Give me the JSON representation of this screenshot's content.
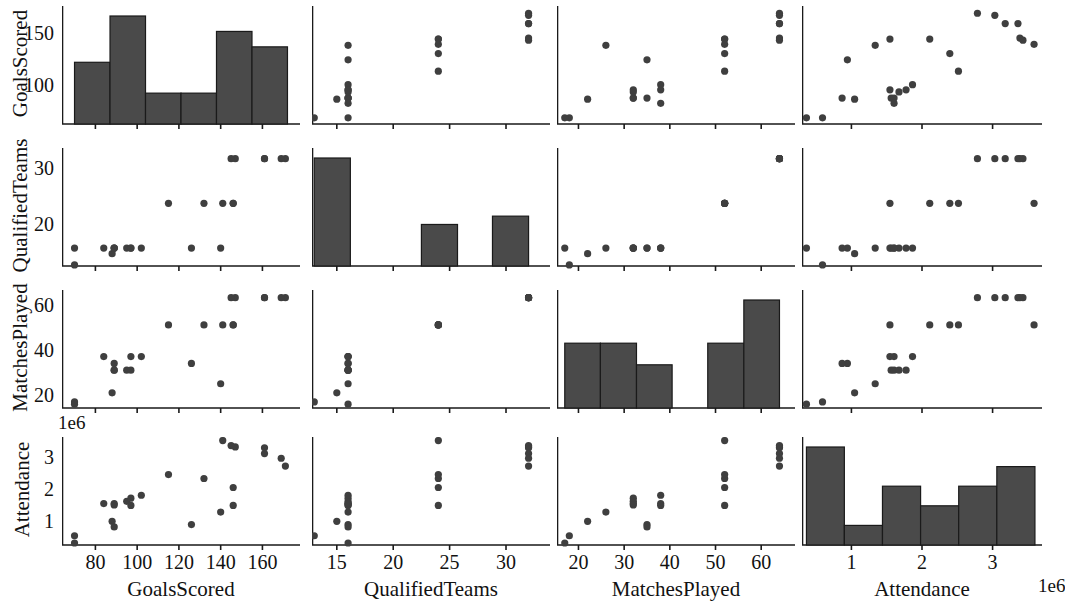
{
  "figure": {
    "type": "pairplot",
    "width": 1048,
    "height": 598,
    "background": "#ffffff",
    "marker_color": "#3f3f3f",
    "bar_color": "#4a4a4a",
    "bar_edge_color": "#1a1a1a",
    "axis_color": "#1a1a1a"
  },
  "variables": [
    {
      "key": "GoalsScored",
      "label": "GoalsScored"
    },
    {
      "key": "QualifiedTeams",
      "label": "QualifiedTeams"
    },
    {
      "key": "MatchesPlayed",
      "label": "MatchesPlayed"
    },
    {
      "key": "Attendance",
      "label": "Attendance"
    }
  ],
  "axes": {
    "GoalsScored": {
      "min": 64,
      "max": 178,
      "ticks": [
        80,
        100,
        120,
        140,
        160
      ],
      "ticklabels": [
        "80",
        "100",
        "120",
        "140",
        "160"
      ],
      "offset": ""
    },
    "QualifiedTeams": {
      "min": 12.8,
      "max": 33.9,
      "ticks": [
        15,
        20,
        25,
        30
      ],
      "ticklabels": [
        "15",
        "20",
        "25",
        "30"
      ],
      "offset": ""
    },
    "MatchesPlayed": {
      "min": 15.3,
      "max": 67.4,
      "ticks": [
        20,
        30,
        40,
        50,
        60
      ],
      "ticklabels": [
        "20",
        "30",
        "40",
        "50",
        "60"
      ],
      "offset": ""
    },
    "Attendance": {
      "min": 300000,
      "max": 3700000,
      "ticks": [
        1000000,
        2000000,
        3000000
      ],
      "ticklabels": [
        "1",
        "2",
        "3"
      ],
      "offset": "1e6"
    }
  },
  "yaxes": {
    "GoalsScored": {
      "ticks": [
        100,
        150
      ],
      "ticklabels": [
        "100",
        "150"
      ]
    },
    "QualifiedTeams": {
      "ticks": [
        20,
        30
      ],
      "ticklabels": [
        "20",
        "30"
      ]
    },
    "MatchesPlayed": {
      "ticks": [
        20,
        40,
        60
      ],
      "ticklabels": [
        "20",
        "40",
        "60"
      ]
    },
    "Attendance": {
      "ticks": [
        1000000,
        2000000,
        3000000
      ],
      "ticklabels": [
        "1",
        "2",
        "3"
      ]
    }
  },
  "chart_data": {
    "type": "scatter",
    "title": "",
    "xlabel": "",
    "ylabel": "",
    "grid": false,
    "legend": null,
    "variables": [
      "GoalsScored",
      "QualifiedTeams",
      "MatchesPlayed",
      "Attendance"
    ],
    "axis_ranges": {
      "GoalsScored": [
        64,
        178
      ],
      "QualifiedTeams": [
        12.8,
        33.9
      ],
      "MatchesPlayed": [
        15.3,
        67.4
      ],
      "Attendance": [
        300000,
        3700000
      ]
    },
    "n_points": 21,
    "points": [
      {
        "GoalsScored": 70,
        "QualifiedTeams": 13,
        "MatchesPlayed": 18,
        "Attendance": 590549
      },
      {
        "GoalsScored": 70,
        "QualifiedTeams": 16,
        "MatchesPlayed": 17,
        "Attendance": 363000
      },
      {
        "GoalsScored": 88,
        "QualifiedTeams": 15,
        "MatchesPlayed": 22,
        "Attendance": 1045246
      },
      {
        "GoalsScored": 140,
        "QualifiedTeams": 16,
        "MatchesPlayed": 26,
        "Attendance": 1337000
      },
      {
        "GoalsScored": 126,
        "QualifiedTeams": 16,
        "MatchesPlayed": 35,
        "Attendance": 943000
      },
      {
        "GoalsScored": 89,
        "QualifiedTeams": 16,
        "MatchesPlayed": 35,
        "Attendance": 868000
      },
      {
        "GoalsScored": 89,
        "QualifiedTeams": 16,
        "MatchesPlayed": 32,
        "Attendance": 1563135
      },
      {
        "GoalsScored": 89,
        "QualifiedTeams": 16,
        "MatchesPlayed": 32,
        "Attendance": 1603975
      },
      {
        "GoalsScored": 95,
        "QualifiedTeams": 16,
        "MatchesPlayed": 32,
        "Attendance": 1673975
      },
      {
        "GoalsScored": 97,
        "QualifiedTeams": 16,
        "MatchesPlayed": 32,
        "Attendance": 1774022
      },
      {
        "GoalsScored": 102,
        "QualifiedTeams": 16,
        "MatchesPlayed": 38,
        "Attendance": 1865753
      },
      {
        "GoalsScored": 97,
        "QualifiedTeams": 16,
        "MatchesPlayed": 38,
        "Attendance": 1545791
      },
      {
        "GoalsScored": 84,
        "QualifiedTeams": 16,
        "MatchesPlayed": 38,
        "Attendance": 1603975
      },
      {
        "GoalsScored": 146,
        "QualifiedTeams": 24,
        "MatchesPlayed": 52,
        "Attendance": 1545791
      },
      {
        "GoalsScored": 146,
        "QualifiedTeams": 24,
        "MatchesPlayed": 52,
        "Attendance": 2109723
      },
      {
        "GoalsScored": 132,
        "QualifiedTeams": 24,
        "MatchesPlayed": 52,
        "Attendance": 2394031
      },
      {
        "GoalsScored": 115,
        "QualifiedTeams": 24,
        "MatchesPlayed": 52,
        "Attendance": 2516215
      },
      {
        "GoalsScored": 141,
        "QualifiedTeams": 24,
        "MatchesPlayed": 52,
        "Attendance": 3587538
      },
      {
        "GoalsScored": 171,
        "QualifiedTeams": 32,
        "MatchesPlayed": 64,
        "Attendance": 2785100
      },
      {
        "GoalsScored": 161,
        "QualifiedTeams": 32,
        "MatchesPlayed": 64,
        "Attendance": 3359439
      },
      {
        "GoalsScored": 161,
        "QualifiedTeams": 32,
        "MatchesPlayed": 64,
        "Attendance": 3178856
      },
      {
        "GoalsScored": 147,
        "QualifiedTeams": 32,
        "MatchesPlayed": 64,
        "Attendance": 3386810
      },
      {
        "GoalsScored": 145,
        "QualifiedTeams": 32,
        "MatchesPlayed": 64,
        "Attendance": 3429873
      },
      {
        "GoalsScored": 169,
        "QualifiedTeams": 32,
        "MatchesPlayed": 64,
        "Attendance": 3031768
      }
    ],
    "histograms": {
      "GoalsScored": {
        "bin_edges": [
          70,
          87,
          104,
          121,
          138,
          155,
          172
        ],
        "counts": [
          4,
          7,
          2,
          2,
          6,
          5
        ]
      },
      "QualifiedTeams": {
        "bin_edges": [
          13,
          16.2,
          19.3,
          22.5,
          25.7,
          28.8,
          32
        ],
        "counts": [
          13,
          0,
          0,
          5,
          0,
          6
        ]
      },
      "MatchesPlayed": {
        "bin_edges": [
          17,
          24.8,
          32.7,
          40.5,
          48.3,
          56.2,
          64
        ],
        "counts": [
          3,
          3,
          2,
          0,
          3,
          5
        ]
      },
      "Attendance": {
        "bin_edges": [
          363000,
          900000,
          1440000,
          1980000,
          2520000,
          3060000,
          3600000
        ],
        "counts": [
          5,
          1,
          3,
          2,
          3,
          4
        ]
      }
    }
  }
}
